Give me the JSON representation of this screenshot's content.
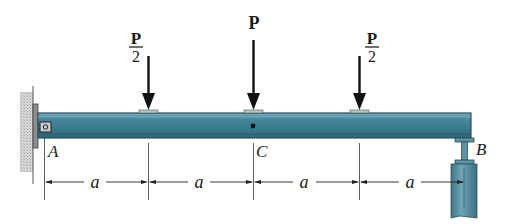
{
  "diagram": {
    "type": "simply supported beam with point loads",
    "colors": {
      "beam_fill": "#3f7f94",
      "beam_highlight": "#6aa3b5",
      "beam_edge": "#2b4f5c",
      "support": "#4d7f8f",
      "wall": "#b8b8b8",
      "ink": "#1a1a1a"
    },
    "loads": [
      {
        "id": "load-left",
        "numerator": "P",
        "denominator": "2",
        "fraction": true
      },
      {
        "id": "load-center",
        "label": "P",
        "fraction": false
      },
      {
        "id": "load-right",
        "numerator": "P",
        "denominator": "2",
        "fraction": true
      }
    ],
    "points": {
      "A": "A",
      "B": "B",
      "C": "C"
    },
    "dimensions": [
      "a",
      "a",
      "a",
      "a"
    ]
  }
}
